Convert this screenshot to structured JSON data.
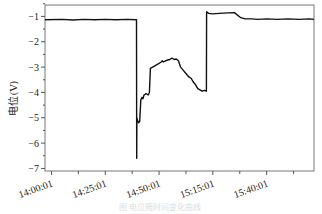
{
  "chart_data": {
    "type": "line",
    "title": "",
    "xlabel": "",
    "ylabel": "电位(V)",
    "caption": "图 电位随时间变化曲线",
    "xlim_minutes": [
      -3,
      122
    ],
    "ylim": [
      -7.1,
      -0.55
    ],
    "x_ticks": [
      {
        "minutes": 0,
        "label": "14:00:01"
      },
      {
        "minutes": 25,
        "label": "14:25:01"
      },
      {
        "minutes": 50,
        "label": "14:50:01"
      },
      {
        "minutes": 75,
        "label": "15:15:01"
      },
      {
        "minutes": 100,
        "label": "15:40:01"
      }
    ],
    "x_minor_ticks_minutes": [
      12.5,
      37.5,
      62.5,
      87.5,
      112.5
    ],
    "y_ticks": [
      -1,
      -2,
      -3,
      -4,
      -5,
      -6,
      -7
    ],
    "grid": false,
    "series": [
      {
        "name": "电位",
        "color": "#111111",
        "x_minutes": [
          -3,
          5,
          10,
          15,
          20,
          25,
          30,
          35,
          39.5,
          39.6,
          39.7,
          40,
          40.5,
          41,
          41.5,
          42,
          42.5,
          43,
          44,
          45,
          45.5,
          46,
          47,
          48,
          49,
          50,
          51,
          51.5,
          52,
          53,
          54,
          55,
          56,
          57,
          58,
          59,
          60,
          61,
          62,
          63,
          64,
          65,
          66,
          67,
          68,
          69,
          70,
          71,
          72,
          72.1,
          73,
          75,
          78,
          80,
          82,
          85,
          88,
          90,
          93,
          96,
          100,
          105,
          110,
          115,
          120,
          122
        ],
        "y": [
          -1.13,
          -1.12,
          -1.14,
          -1.12,
          -1.13,
          -1.12,
          -1.13,
          -1.12,
          -1.13,
          -6.6,
          -5.0,
          -5.1,
          -5.2,
          -5.15,
          -4.3,
          -4.2,
          -4.25,
          -4.1,
          -4.05,
          -4.1,
          -4.0,
          -3.05,
          -3.0,
          -2.95,
          -2.9,
          -2.85,
          -2.8,
          -2.75,
          -2.8,
          -2.75,
          -2.72,
          -2.7,
          -2.65,
          -2.7,
          -2.68,
          -2.75,
          -3.0,
          -3.1,
          -3.2,
          -3.3,
          -3.4,
          -3.45,
          -3.6,
          -3.7,
          -3.85,
          -3.9,
          -3.95,
          -3.92,
          -3.95,
          -0.82,
          -0.88,
          -0.9,
          -0.88,
          -0.87,
          -0.86,
          -0.85,
          -1.05,
          -1.1,
          -1.1,
          -1.12,
          -1.1,
          -1.12,
          -1.1,
          -1.12,
          -1.1,
          -1.12
        ]
      }
    ]
  }
}
